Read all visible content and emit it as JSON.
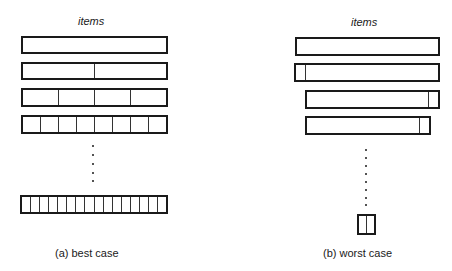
{
  "panel_a": {
    "header": "items",
    "caption": "(a)  best case",
    "rows": [
      {
        "segments": 1
      },
      {
        "segments": 2
      },
      {
        "segments": 4
      },
      {
        "segments": 8
      }
    ],
    "ellipsis_dots": 5,
    "final_row": {
      "segments": 16
    }
  },
  "panel_b": {
    "header": "items",
    "caption": "(b)  worst case",
    "rows": [
      {
        "description": "full array",
        "split": "none"
      },
      {
        "description": "one item split off left",
        "split": "left"
      },
      {
        "description": "one item split off right",
        "split": "right"
      },
      {
        "description": "one item split off right",
        "split": "right"
      }
    ],
    "ellipsis_dots": 8,
    "final_box": {
      "segments": 2
    }
  }
}
